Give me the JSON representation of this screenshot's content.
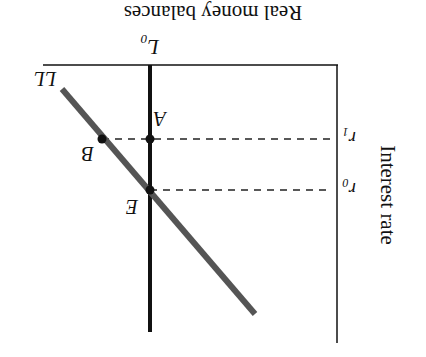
{
  "diagram": {
    "orientation": "rotated-180",
    "axes": {
      "x_label": "Real money balances",
      "y_label": "Interest rate"
    },
    "curves": {
      "supply_label": "L",
      "supply_subscript": "0",
      "demand_label": "LL"
    },
    "rates": {
      "r1_base": "r",
      "r1_sub": "1",
      "r0_base": "r",
      "r0_sub": "0"
    },
    "points": {
      "A": "A",
      "B": "B",
      "E": "E"
    },
    "colors": {
      "axis": "#111111",
      "supply_line": "#111111",
      "demand_line": "#555555",
      "dashes": "#222222"
    }
  }
}
